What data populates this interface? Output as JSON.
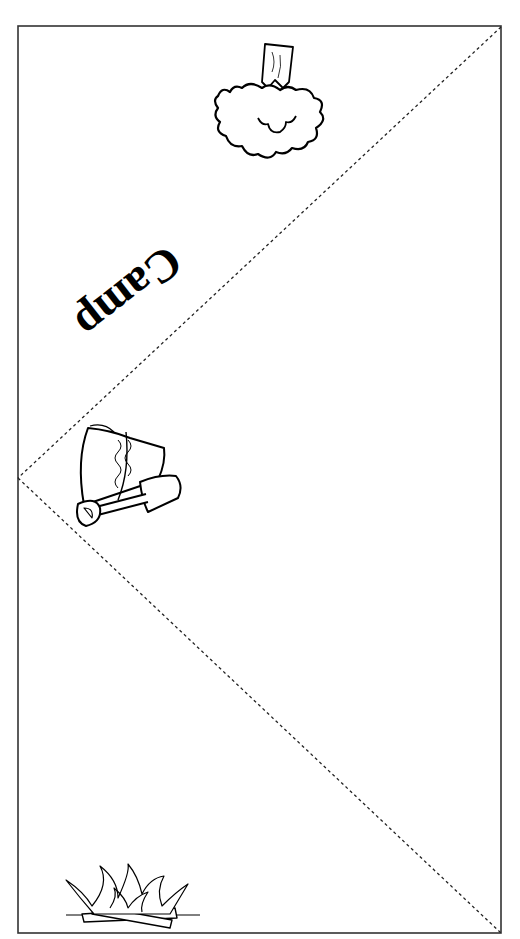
{
  "document": {
    "type": "printable fold template",
    "label": "Camp",
    "colors": {
      "line": "#000000",
      "border": "#333333",
      "background": "#ffffff"
    }
  },
  "illustrations": [
    {
      "name": "tree",
      "position": "top center, upside-down"
    },
    {
      "name": "bucket-and-shovel",
      "position": "left middle"
    },
    {
      "name": "campfire",
      "position": "bottom left"
    }
  ],
  "fold_lines": [
    {
      "from": [
        501,
        27
      ],
      "to": [
        18,
        478
      ],
      "style": "dashed"
    },
    {
      "from": [
        18,
        478
      ],
      "to": [
        501,
        933
      ],
      "style": "dashed"
    }
  ]
}
